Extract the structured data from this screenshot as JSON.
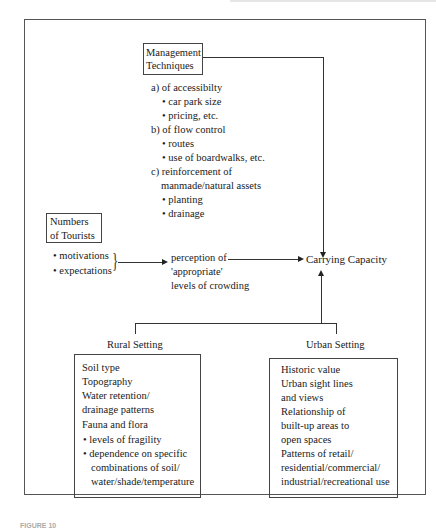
{
  "diagram": {
    "management": {
      "title_lines": [
        "Management",
        "Techniques"
      ],
      "items": [
        {
          "label": "a) of accessibilty",
          "bullets": [
            "car park size",
            "pricing, etc."
          ]
        },
        {
          "label": "b) of flow control",
          "bullets": [
            "routes",
            "use of boardwalks, etc."
          ]
        },
        {
          "label_lines": [
            "c) reinforcement of",
            "manmade/natural assets"
          ],
          "bullets": [
            "planting",
            "drainage"
          ]
        }
      ]
    },
    "tourists": {
      "title_lines": [
        "Numbers",
        "of Tourists"
      ],
      "bullets": [
        "motivations",
        "expectations"
      ]
    },
    "perception": {
      "lines": [
        "perception of",
        "'appropriate'",
        "levels of crowding"
      ]
    },
    "carrying_capacity": "Carrying Capacity",
    "rural": {
      "label": "Rural Setting",
      "lines": [
        "Soil type",
        "Topography",
        "Water retention/",
        "drainage patterns",
        "Fauna and flora"
      ],
      "bullets": [
        "levels of fragility",
        "dependence on specific"
      ],
      "continuation": [
        "combinations of soil/",
        "water/shade/temperature"
      ]
    },
    "urban": {
      "label": "Urban Setting",
      "lines": [
        "Historic value",
        "Urban sight lines",
        "and views",
        "Relationship of",
        "built-up areas to",
        "open spaces",
        "Patterns of retail/",
        "residential/commercial/",
        "industrial/recreational use"
      ]
    },
    "caption": "FIGURE 10"
  }
}
